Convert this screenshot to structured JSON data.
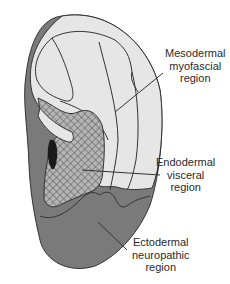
{
  "diagram": {
    "colors": {
      "mesodermal_fill": "#e6e6e6",
      "endodermal_hatch_bg": "#b5b5b5",
      "endodermal_hatch_line": "#555555",
      "ectodermal_fill": "#7a7a7a",
      "dark_spot": "#1a1a1a",
      "outline": "#333333",
      "text": "#2a2a2a"
    },
    "labels": {
      "mesodermal": {
        "line1": "Mesodermal",
        "line2": "myofascial",
        "line3": "region"
      },
      "endodermal": {
        "line1": "Endodermal",
        "line2": "visceral",
        "line3": "region"
      },
      "ectodermal": {
        "line1": "Ectodermal",
        "line2": "neuropathic",
        "line3": "region"
      }
    }
  }
}
